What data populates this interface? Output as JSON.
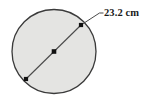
{
  "figure": {
    "type": "geometry-diagram",
    "canvas": {
      "width": 145,
      "height": 100,
      "background": "#ffffff"
    },
    "title": "",
    "circle": {
      "center_x": 54,
      "center_y": 51.5,
      "radius": 42,
      "fill_color": "#e4e4e2",
      "stroke_color": "#3a3a3a",
      "stroke_width": 1.3
    },
    "diameter": {
      "label": "23.2 cm",
      "value": 23.2,
      "unit": "cm",
      "stroke_color": "#4a4a4a",
      "stroke_width": 1.1,
      "start_x": 26,
      "start_y": 79,
      "end_x": 81,
      "end_y": 25
    },
    "points": [
      {
        "name": "endpoint-lower-left",
        "x": 26,
        "y": 79,
        "size": 4.2,
        "color": "#111111"
      },
      {
        "name": "center-point",
        "x": 54,
        "y": 51.5,
        "size": 4.6,
        "color": "#111111"
      },
      {
        "name": "endpoint-upper-right",
        "x": 81,
        "y": 25,
        "size": 4.2,
        "color": "#111111"
      }
    ],
    "leader": {
      "from_x": 81,
      "from_y": 25,
      "bend_x": 99.5,
      "bend_y": 13,
      "to_x": 103.5,
      "to_y": 13,
      "stroke_color": "#4a4a4a",
      "stroke_width": 1
    },
    "label_position": {
      "left": 104,
      "top": 8
    }
  }
}
